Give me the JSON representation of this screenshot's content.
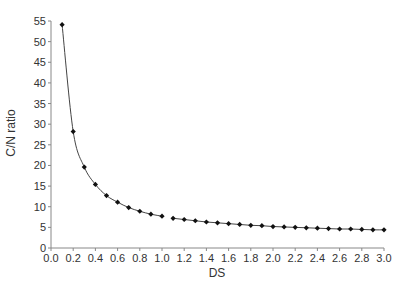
{
  "chart_data": {
    "type": "line",
    "title": "",
    "xlabel": "DS",
    "ylabel": "C/N ratio",
    "xlim": [
      0.0,
      3.0
    ],
    "ylim": [
      0,
      55
    ],
    "grid": false,
    "legend": null,
    "x_ticks": [
      "0.0",
      "0.2",
      "0.4",
      "0.6",
      "0.8",
      "1.0",
      "1.2",
      "1.4",
      "1.6",
      "1.8",
      "2.0",
      "2.2",
      "2.4",
      "2.6",
      "2.8",
      "3.0"
    ],
    "y_ticks": [
      "0",
      "5",
      "10",
      "15",
      "20",
      "25",
      "30",
      "35",
      "40",
      "45",
      "50",
      "55"
    ],
    "series": [
      {
        "name": "C/N ratio",
        "marker": "diamond",
        "color": "#111111",
        "line_color": "#444444",
        "segments": [
          {
            "x": [
              0.1,
              0.2,
              0.3,
              0.4,
              0.5,
              0.6,
              0.7,
              0.8,
              0.9,
              1.0
            ],
            "y": [
              54.1,
              28.2,
              19.6,
              15.4,
              12.7,
              11.1,
              9.8,
              8.9,
              8.2,
              7.7
            ]
          },
          {
            "x": [
              1.1,
              1.2,
              1.3,
              1.4,
              1.5,
              1.6,
              1.7,
              1.8,
              1.9,
              2.0,
              2.1,
              2.2,
              2.3,
              2.4,
              2.5,
              2.6,
              2.7,
              2.8,
              2.9,
              3.0
            ],
            "y": [
              7.2,
              6.9,
              6.6,
              6.3,
              6.1,
              5.9,
              5.7,
              5.5,
              5.4,
              5.2,
              5.1,
              5.0,
              4.9,
              4.8,
              4.7,
              4.6,
              4.6,
              4.5,
              4.4,
              4.4
            ]
          }
        ]
      }
    ]
  }
}
